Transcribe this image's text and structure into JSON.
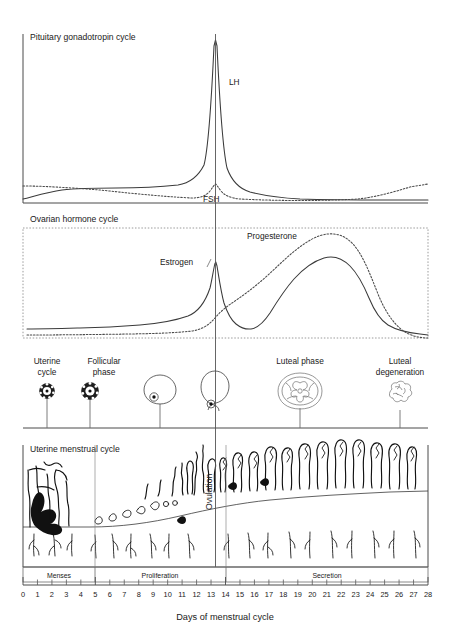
{
  "figure": {
    "caption": "Days of menstrual cycle"
  },
  "panels": {
    "pituitary": {
      "title": "Pituitary gonadotropin cycle",
      "curves": [
        {
          "name": "LH",
          "label": "LH",
          "style": "solid"
        },
        {
          "name": "FSH",
          "label": "FSH",
          "style": "dotted"
        }
      ]
    },
    "ovarian": {
      "title": "Ovarian hormone cycle",
      "curves": [
        {
          "name": "Estrogen",
          "label": "Estrogen",
          "style": "solid"
        },
        {
          "name": "Progesterone",
          "label": "Progesterone",
          "style": "dotted"
        }
      ]
    },
    "follicle": {
      "stages": [
        {
          "label_line1": "Uterine",
          "label_line2": "cycle",
          "day": 1,
          "icon": "primordial-follicle-icon"
        },
        {
          "label_line1": "Follicular",
          "label_line2": "phase",
          "day": 5,
          "icon": "primary-follicle-icon"
        },
        {
          "label_line1": "",
          "label_line2": "",
          "day": 10,
          "icon": "graafian-follicle-icon"
        },
        {
          "label_line1": "",
          "label_line2": "",
          "day": 14,
          "icon": "ovulating-follicle-icon"
        },
        {
          "label_line1": "Luteal phase",
          "label_line2": "",
          "day": 21,
          "icon": "corpus-luteum-icon"
        },
        {
          "label_line1": "Luteal",
          "label_line2": "degeneration",
          "day": 26,
          "icon": "corpus-albicans-icon"
        }
      ]
    },
    "uterine": {
      "title": "Uterine menstrual cycle",
      "ovulation_label": "Ovulation",
      "bands": [
        {
          "label": "Menses",
          "start_day": 0,
          "end_day": 5
        },
        {
          "label": "Proliferation",
          "start_day": 5,
          "end_day": 14
        },
        {
          "label": "Secretion",
          "start_day": 14,
          "end_day": 28
        }
      ]
    }
  },
  "axis": {
    "label": "Days of menstrual cycle",
    "ticks": [
      "0",
      "1",
      "2",
      "3",
      "4",
      "5",
      "6",
      "7",
      "8",
      "9",
      "10",
      "11",
      "12",
      "13",
      "14",
      "15",
      "16",
      "17",
      "18",
      "19",
      "20",
      "21",
      "22",
      "23",
      "24",
      "25",
      "26",
      "27",
      "28"
    ],
    "min_day": 0,
    "max_day": 28,
    "ovulation_day": 14
  },
  "chart_data": {
    "type": "line",
    "xlabel": "Days of menstrual cycle",
    "ylabel": "Relative hormone level",
    "x": [
      0,
      1,
      2,
      3,
      4,
      5,
      6,
      7,
      8,
      9,
      10,
      11,
      12,
      13,
      14,
      15,
      16,
      17,
      18,
      19,
      20,
      21,
      22,
      23,
      24,
      25,
      26,
      27,
      28
    ],
    "xlim": [
      0,
      28
    ],
    "grid": false,
    "legend_position": "inline-annotation",
    "annotations": [
      "LH",
      "FSH",
      "Estrogen",
      "Progesterone",
      "Ovulation"
    ],
    "panels": [
      {
        "name": "Pituitary gonadotropin cycle",
        "ylim": [
          0,
          100
        ],
        "series": [
          {
            "name": "LH",
            "style": "solid",
            "values": [
              3,
              4,
              6,
              8,
              9,
              10,
              11,
              11,
              12,
              12,
              13,
              15,
              20,
              45,
              100,
              40,
              16,
              9,
              6,
              5,
              4,
              4,
              4,
              4,
              4,
              4,
              4,
              5,
              5
            ]
          },
          {
            "name": "FSH",
            "style": "dotted",
            "values": [
              16,
              16,
              15,
              15,
              14,
              13,
              12,
              11,
              10,
              9,
              9,
              8,
              8,
              10,
              20,
              10,
              7,
              6,
              6,
              5,
              5,
              5,
              5,
              5,
              6,
              8,
              11,
              14,
              16
            ]
          }
        ]
      },
      {
        "name": "Ovarian hormone cycle",
        "ylim": [
          0,
          100
        ],
        "series": [
          {
            "name": "Estrogen",
            "style": "solid",
            "values": [
              8,
              8,
              8,
              9,
              9,
              10,
              11,
              12,
              14,
              16,
              19,
              24,
              34,
              58,
              88,
              40,
              20,
              22,
              30,
              42,
              55,
              66,
              72,
              70,
              62,
              48,
              32,
              18,
              8
            ]
          },
          {
            "name": "Progesterone",
            "style": "dotted",
            "values": [
              2,
              2,
              2,
              2,
              2,
              2,
              3,
              3,
              3,
              4,
              5,
              7,
              12,
              22,
              36,
              44,
              52,
              62,
              72,
              82,
              90,
              94,
              92,
              85,
              72,
              56,
              38,
              20,
              6
            ]
          }
        ]
      }
    ],
    "follicle_stages": [
      {
        "day": 1,
        "stage": "Primordial follicle"
      },
      {
        "day": 5,
        "stage": "Primary follicle"
      },
      {
        "day": 10,
        "stage": "Graafian follicle"
      },
      {
        "day": 14,
        "stage": "Ovulation"
      },
      {
        "day": 21,
        "stage": "Corpus luteum"
      },
      {
        "day": 26,
        "stage": "Corpus albicans"
      }
    ],
    "endometrial_phases": [
      {
        "phase": "Menses",
        "start_day": 0,
        "end_day": 5,
        "thickness_relative": [
          30,
          20,
          12,
          10,
          10
        ]
      },
      {
        "phase": "Proliferation",
        "start_day": 5,
        "end_day": 14,
        "thickness_relative": [
          10,
          14,
          18,
          23,
          28,
          34,
          40,
          46,
          52
        ]
      },
      {
        "phase": "Secretion",
        "start_day": 14,
        "end_day": 28,
        "thickness_relative": [
          56,
          62,
          66,
          70,
          74,
          78,
          82,
          86,
          88,
          88,
          86,
          82,
          76,
          70
        ]
      }
    ]
  }
}
